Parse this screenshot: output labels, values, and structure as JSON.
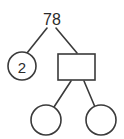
{
  "diagram": {
    "type": "factor-tree",
    "background_color": "#ffffff",
    "stroke_color": "#3a3a3a",
    "text_color": "#2b2b2b",
    "root": {
      "label": "78",
      "shape": "none",
      "x": 52,
      "y": 19
    },
    "nodes": [
      {
        "id": "left-factor",
        "label": "2",
        "shape": "circle",
        "cx": 22,
        "cy": 66,
        "r": 14,
        "empty": false
      },
      {
        "id": "right-factor",
        "label": "",
        "shape": "rectangle",
        "x": 58,
        "y": 54,
        "width": 37,
        "height": 26,
        "empty": true
      },
      {
        "id": "child-left",
        "label": "",
        "shape": "circle",
        "cx": 46,
        "cy": 120,
        "r": 15,
        "empty": true
      },
      {
        "id": "child-right",
        "label": "",
        "shape": "circle",
        "cx": 101,
        "cy": 120,
        "r": 15,
        "empty": true
      }
    ],
    "connectors": [
      {
        "id": "root-to-left-factor",
        "x1": 47,
        "y1": 28,
        "x2": 27,
        "y2": 53
      },
      {
        "id": "root-to-right-factor",
        "x1": 56,
        "y1": 28,
        "x2": 77,
        "y2": 53
      },
      {
        "id": "rect-to-child-left",
        "x1": 71,
        "y1": 81,
        "x2": 54,
        "y2": 107
      },
      {
        "id": "rect-to-child-right",
        "x1": 84,
        "y1": 81,
        "x2": 95,
        "y2": 107
      }
    ]
  }
}
